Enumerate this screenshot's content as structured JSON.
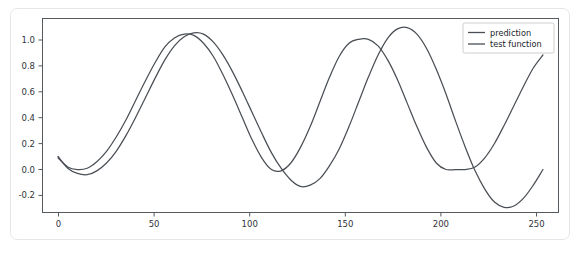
{
  "figure": {
    "background_color": "#ffffff",
    "card_border_color": "#e6e6e6",
    "line_color": "#4a4f55",
    "axis_color": "#555a5e"
  },
  "legend": {
    "entries": [
      {
        "label": "prediction",
        "color": "#4a4f55"
      },
      {
        "label": "test function",
        "color": "#4a4f55"
      }
    ],
    "position": "upper right"
  },
  "axes": {
    "x_ticks": [
      "0",
      "50",
      "100",
      "150",
      "200",
      "250"
    ],
    "y_ticks": [
      "-0.2",
      "0.0",
      "0.2",
      "0.4",
      "0.6",
      "0.8",
      "1.0"
    ]
  },
  "chart_data": {
    "type": "line",
    "title": "",
    "xlabel": "",
    "ylabel": "",
    "xlim": [
      -8,
      258
    ],
    "ylim": [
      -0.33,
      1.16
    ],
    "grid": false,
    "legend_position": "upper right",
    "x_ticks": [
      0,
      50,
      100,
      150,
      200,
      250
    ],
    "y_ticks": [
      -0.2,
      0.0,
      0.2,
      0.4,
      0.6,
      0.8,
      1.0
    ],
    "x": [
      0,
      5,
      10,
      15,
      20,
      25,
      30,
      35,
      40,
      45,
      50,
      55,
      60,
      65,
      70,
      75,
      80,
      85,
      90,
      95,
      100,
      105,
      110,
      115,
      120,
      125,
      130,
      135,
      140,
      145,
      150,
      155,
      160,
      165,
      170,
      175,
      180,
      185,
      190,
      195,
      200,
      205,
      210,
      215,
      220,
      225,
      230,
      235,
      240,
      245,
      250
    ],
    "series": [
      {
        "name": "prediction",
        "color": "#4a4f55",
        "values": [
          0.1,
          0.01,
          -0.03,
          -0.04,
          -0.01,
          0.05,
          0.14,
          0.26,
          0.4,
          0.55,
          0.7,
          0.84,
          0.95,
          1.02,
          1.05,
          1.04,
          0.98,
          0.88,
          0.75,
          0.6,
          0.44,
          0.28,
          0.13,
          0.01,
          -0.08,
          -0.13,
          -0.12,
          -0.07,
          0.03,
          0.16,
          0.33,
          0.52,
          0.71,
          0.88,
          1.01,
          1.08,
          1.09,
          1.04,
          0.93,
          0.77,
          0.58,
          0.37,
          0.17,
          -0.01,
          -0.15,
          -0.25,
          -0.29,
          -0.28,
          -0.22,
          -0.12,
          0.0
        ],
        "notes": "lower-amplitude-leading-curve peaks ~1.05 at x=67 and ~1.09 at x=178, troughs ~-0.13 at x=122 and ~-0.29 at x=232, ends near 0.00 at x=250"
      },
      {
        "name": "test function",
        "color": "#4a4f55",
        "values": [
          0.09,
          0.02,
          0.0,
          0.01,
          0.06,
          0.14,
          0.25,
          0.38,
          0.53,
          0.68,
          0.82,
          0.94,
          1.01,
          1.04,
          1.03,
          0.97,
          0.87,
          0.73,
          0.57,
          0.4,
          0.23,
          0.09,
          0.0,
          -0.01,
          0.05,
          0.17,
          0.33,
          0.52,
          0.71,
          0.87,
          0.97,
          1.0,
          1.0,
          0.95,
          0.84,
          0.69,
          0.51,
          0.33,
          0.17,
          0.05,
          0.0,
          0.0,
          0.0,
          0.02,
          0.09,
          0.2,
          0.34,
          0.49,
          0.64,
          0.78,
          0.88
        ],
        "notes": "reference curve peaks ~1.04 at x=62 and ~1.00 at x=160, troughs ~0.00 at x=110 and ~0.00 near x=205-215, rises to ~0.88 at x=250"
      }
    ]
  }
}
